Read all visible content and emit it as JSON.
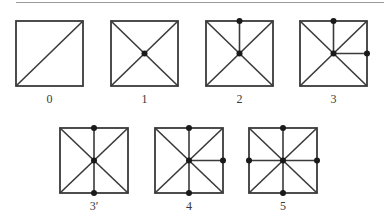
{
  "figure": {
    "line_color": "#3a3a3a",
    "rule_color": "#9a9a9a",
    "panels": [
      {
        "label": "0",
        "x": 16,
        "y": 21,
        "w": 67,
        "h": 65,
        "edges": [
          "diag-bl-tr"
        ],
        "dots": []
      },
      {
        "label": "1",
        "x": 111,
        "y": 21,
        "w": 67,
        "h": 65,
        "edges": [
          "diag-bl-tr",
          "diag-tl-br"
        ],
        "dots": [
          "center"
        ]
      },
      {
        "label": "2",
        "x": 206,
        "y": 21,
        "w": 67,
        "h": 65,
        "edges": [
          "diag-bl-tr",
          "diag-tl-br",
          "center-top"
        ],
        "dots": [
          "center",
          "top"
        ]
      },
      {
        "label": "3",
        "x": 300,
        "y": 21,
        "w": 67,
        "h": 65,
        "edges": [
          "diag-bl-tr",
          "diag-tl-br",
          "center-top",
          "center-right"
        ],
        "dots": [
          "center",
          "top",
          "right"
        ]
      },
      {
        "label": "3′",
        "x": 60,
        "y": 128,
        "w": 68,
        "h": 65,
        "edges": [
          "diag-bl-tr",
          "diag-tl-br",
          "center-top",
          "center-bottom"
        ],
        "dots": [
          "center",
          "top",
          "bottom"
        ]
      },
      {
        "label": "4",
        "x": 155,
        "y": 128,
        "w": 68,
        "h": 65,
        "edges": [
          "diag-bl-tr",
          "diag-tl-br",
          "center-top",
          "center-bottom",
          "center-right"
        ],
        "dots": [
          "center",
          "top",
          "bottom",
          "right"
        ]
      },
      {
        "label": "5",
        "x": 249,
        "y": 128,
        "w": 68,
        "h": 65,
        "edges": [
          "diag-bl-tr",
          "diag-tl-br",
          "center-top",
          "center-bottom",
          "center-right",
          "center-left"
        ],
        "dots": [
          "center",
          "top",
          "bottom",
          "right",
          "left"
        ]
      }
    ]
  }
}
